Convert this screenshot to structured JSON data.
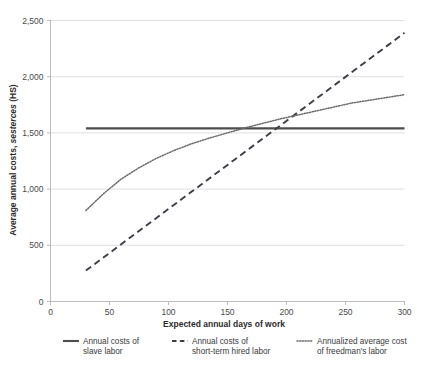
{
  "chart_data": {
    "type": "line",
    "title": "",
    "xlabel": "Expected annual days of work",
    "ylabel": "Average annual costs, sesterces (HS)",
    "ylabel_parts": {
      "plain_prefix": "Average annual costs, ",
      "italic": "sesterces",
      "plain_suffix": " (HS)"
    },
    "xlim": [
      0,
      300
    ],
    "ylim": [
      0,
      2500
    ],
    "xticks": [
      0,
      50,
      100,
      150,
      200,
      250,
      300
    ],
    "xtick_labels": [
      "0",
      "50",
      "100",
      "150",
      "200",
      "250",
      "300"
    ],
    "yticks": [
      0,
      500,
      1000,
      1500,
      2000,
      2500
    ],
    "ytick_labels": [
      "0",
      "500",
      "1,000",
      "1,500",
      "2,000",
      "2,500"
    ],
    "grid": "horizontal",
    "legend_position": "bottom",
    "series": [
      {
        "name": "Annual costs of slave labor",
        "legend_label_line1": "Annual costs of",
        "legend_label_line2": "slave labor",
        "style": "solid",
        "color": "#4d4d4d",
        "x": [
          30,
          60,
          90,
          120,
          150,
          180,
          210,
          240,
          270,
          300
        ],
        "values": [
          1540,
          1540,
          1540,
          1540,
          1540,
          1540,
          1540,
          1540,
          1540,
          1540
        ]
      },
      {
        "name": "Annual costs of short-term hired labor",
        "legend_label_line1": "Annual costs of",
        "legend_label_line2": "short-term hired labor",
        "style": "dashed",
        "color": "#3d3d4a",
        "x": [
          30,
          60,
          90,
          120,
          150,
          180,
          210,
          240,
          270,
          300
        ],
        "values": [
          275,
          510,
          745,
          980,
          1215,
          1450,
          1685,
          1920,
          2155,
          2390
        ]
      },
      {
        "name": "Annualized average cost of freedman's labor",
        "legend_label_line1": "Annualized average cost",
        "legend_label_line2": "of freedman's labor",
        "style": "dotted",
        "color": "#6a6a6a",
        "x": [
          30,
          45,
          60,
          75,
          90,
          105,
          120,
          135,
          150,
          165,
          180,
          195,
          210,
          225,
          240,
          255,
          270,
          285,
          300
        ],
        "values": [
          810,
          960,
          1090,
          1190,
          1275,
          1345,
          1405,
          1455,
          1500,
          1545,
          1585,
          1625,
          1660,
          1695,
          1730,
          1765,
          1790,
          1815,
          1840
        ]
      }
    ],
    "annotations": {
      "crossing_dotted_solid_x": 170,
      "crossing_dashed_solid_x": 195
    }
  }
}
